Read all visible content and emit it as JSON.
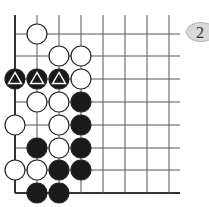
{
  "problem": {
    "number": "2"
  },
  "board": {
    "grid": {
      "x": [
        15,
        37,
        59,
        81,
        103,
        125,
        147,
        169
      ],
      "y": [
        34,
        56,
        79,
        102,
        125,
        148,
        170,
        193
      ],
      "right_end": 180,
      "top_start": 15,
      "line_color": "#555555",
      "edge_color": "#333333"
    },
    "stone_radius": 10,
    "stones": [
      {
        "color": "white",
        "col": 1,
        "row": 0
      },
      {
        "color": "white",
        "col": 2,
        "row": 1
      },
      {
        "color": "white",
        "col": 3,
        "row": 1
      },
      {
        "color": "black",
        "col": 0,
        "row": 2,
        "mark": "triangle"
      },
      {
        "color": "black",
        "col": 1,
        "row": 2,
        "mark": "triangle"
      },
      {
        "color": "black",
        "col": 2,
        "row": 2,
        "mark": "triangle"
      },
      {
        "color": "white",
        "col": 3,
        "row": 2
      },
      {
        "color": "white",
        "col": 1,
        "row": 3
      },
      {
        "color": "white",
        "col": 2,
        "row": 3
      },
      {
        "color": "black",
        "col": 3,
        "row": 3
      },
      {
        "color": "white",
        "col": 0,
        "row": 4
      },
      {
        "color": "white",
        "col": 2,
        "row": 4
      },
      {
        "color": "black",
        "col": 3,
        "row": 4
      },
      {
        "color": "black",
        "col": 1,
        "row": 5
      },
      {
        "color": "white",
        "col": 2,
        "row": 5
      },
      {
        "color": "black",
        "col": 3,
        "row": 5
      },
      {
        "color": "white",
        "col": 0,
        "row": 6
      },
      {
        "color": "white",
        "col": 1,
        "row": 6
      },
      {
        "color": "black",
        "col": 2,
        "row": 6
      },
      {
        "color": "black",
        "col": 3,
        "row": 6
      },
      {
        "color": "black",
        "col": 1,
        "row": 7
      },
      {
        "color": "black",
        "col": 2,
        "row": 7
      }
    ]
  }
}
